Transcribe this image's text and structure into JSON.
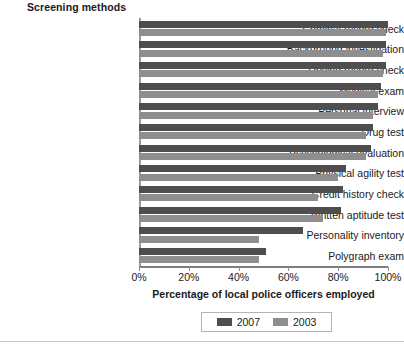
{
  "chart_data": {
    "type": "bar",
    "orientation": "horizontal",
    "title": "",
    "xlabel": "Percentage of local police officers employed",
    "ylabel": "Screening methods",
    "xlim": [
      0,
      100
    ],
    "xticks": [
      "0%",
      "20%",
      "40%",
      "60%",
      "80%",
      "100%"
    ],
    "xtick_values": [
      0,
      20,
      40,
      60,
      80,
      100
    ],
    "grid": false,
    "legend_position": "bottom-center",
    "categories": [
      "Criminal record check",
      "Background investigation",
      "Driving record check",
      "Medical exam",
      "Personal interview",
      "Drug test",
      "Psychological evaluation",
      "Physical agility test",
      "Credit history check",
      "Written aptitude test",
      "Personality inventory",
      "Polygraph exam"
    ],
    "series": [
      {
        "name": "2007",
        "color": "#4e4e4e",
        "values": [
          100,
          99,
          99,
          97,
          96,
          94,
          93,
          83,
          82,
          81,
          66,
          51
        ]
      },
      {
        "name": "2003",
        "color": "#8e8e8e",
        "values": [
          99,
          98,
          98,
          96,
          94,
          91,
          91,
          80,
          72,
          74,
          48,
          48
        ]
      }
    ]
  },
  "legend": {
    "items": [
      {
        "label": "2007",
        "color": "#4e4e4e"
      },
      {
        "label": "2003",
        "color": "#8e8e8e"
      }
    ]
  }
}
